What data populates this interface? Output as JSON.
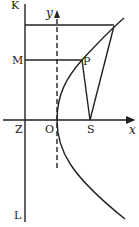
{
  "diagram": {
    "type": "parabola-focus-directrix",
    "labels": {
      "K": "K",
      "L": "L",
      "M": "M",
      "P": "P",
      "Z": "Z",
      "O": "O",
      "S": "S",
      "x_axis": "x",
      "y_axis": "y"
    },
    "colors": {
      "ink": "#222222",
      "background": "#ffffff"
    }
  }
}
